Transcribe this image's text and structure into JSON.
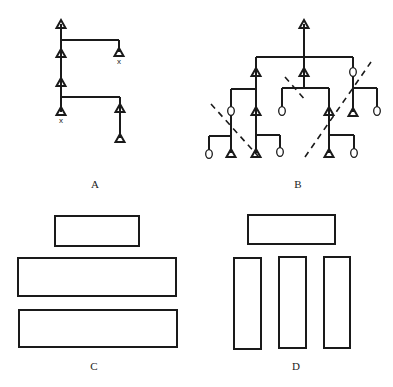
{
  "panels": [
    {
      "id": "A",
      "label": "A",
      "type": "tree-diagram",
      "description": "Chain with two side branches, X-marked terminals"
    },
    {
      "id": "B",
      "label": "B",
      "type": "tree-diagram",
      "description": "Branching tree with triangle and circle nodes, crossed by dashed lines"
    },
    {
      "id": "C",
      "label": "C",
      "type": "block-diagram",
      "description": "Small block above two wide stacked horizontal blocks"
    },
    {
      "id": "D",
      "label": "D",
      "type": "block-diagram",
      "description": "Wide block above three tall vertical blocks"
    }
  ],
  "symbols": {
    "triangle": "triangle-node",
    "circle": "circle-node",
    "x_mark": "X"
  },
  "colors": {
    "ink": "#1a1a1a",
    "background": "#ffffff"
  }
}
